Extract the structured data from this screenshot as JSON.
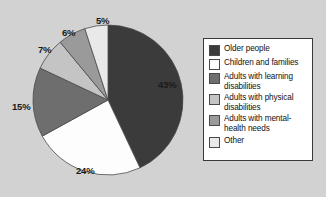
{
  "chart_data": {
    "type": "pie",
    "title": "",
    "categories": [
      "Older people",
      "Children and families",
      "Adults with learning disabilities",
      "Adults with physical disabilities",
      "Adults with mental-health needs",
      "Other"
    ],
    "values": [
      43,
      24,
      15,
      7,
      6,
      5
    ],
    "value_labels": [
      "43%",
      "24%",
      "15%",
      "7%",
      "6%",
      "5%"
    ],
    "colors": [
      "#3b3b3b",
      "#fdfdfd",
      "#6e6e6e",
      "#c4c4c4",
      "#9a9a9a",
      "#e9e9e9"
    ],
    "legend_position": "right",
    "grid": false,
    "xlabel": "",
    "ylabel": ""
  },
  "legend": {
    "entries": [
      {
        "label": "Older people",
        "swatch": "#3b3b3b"
      },
      {
        "label": "Children and families",
        "swatch": "#fdfdfd"
      },
      {
        "label": "Adults with learning disabilities",
        "swatch": "#6e6e6e"
      },
      {
        "label": "Adults with physical disabilities",
        "swatch": "#c4c4c4"
      },
      {
        "label": "Adults with mental-health needs",
        "swatch": "#9a9a9a"
      },
      {
        "label": "Other",
        "swatch": "#e9e9e9"
      }
    ]
  },
  "labels": {
    "p43": "43%",
    "p24": "24%",
    "p15": "15%",
    "p7": "7%",
    "p6": "6%",
    "p5": "5%"
  },
  "style": {
    "background": "#d2d2d2",
    "outline": "#3a3a3a"
  }
}
